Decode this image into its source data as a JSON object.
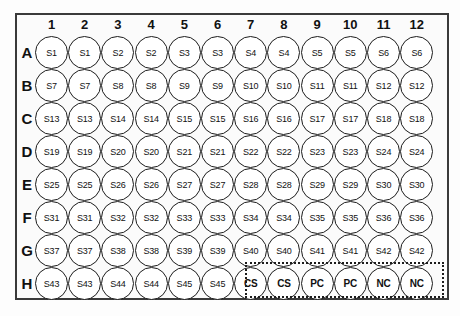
{
  "figure": {
    "kind": "96-well-plate-layout",
    "rows": [
      "A",
      "B",
      "C",
      "D",
      "E",
      "F",
      "G",
      "H"
    ],
    "columns": [
      "1",
      "2",
      "3",
      "4",
      "5",
      "6",
      "7",
      "8",
      "9",
      "10",
      "11",
      "12"
    ],
    "wells": [
      [
        "S1",
        "S1",
        "S2",
        "S2",
        "S3",
        "S3",
        "S4",
        "S4",
        "S5",
        "S5",
        "S6",
        "S6"
      ],
      [
        "S7",
        "S7",
        "S8",
        "S8",
        "S9",
        "S9",
        "S10",
        "S10",
        "S11",
        "S11",
        "S12",
        "S12"
      ],
      [
        "S13",
        "S13",
        "S14",
        "S14",
        "S15",
        "S15",
        "S16",
        "S16",
        "S17",
        "S17",
        "S18",
        "S18"
      ],
      [
        "S19",
        "S19",
        "S20",
        "S20",
        "S21",
        "S21",
        "S22",
        "S22",
        "S23",
        "S23",
        "S24",
        "S24"
      ],
      [
        "S25",
        "S25",
        "S26",
        "S26",
        "S27",
        "S27",
        "S28",
        "S28",
        "S29",
        "S29",
        "S30",
        "S30"
      ],
      [
        "S31",
        "S31",
        "S32",
        "S32",
        "S33",
        "S33",
        "S34",
        "S34",
        "S35",
        "S35",
        "S36",
        "S36"
      ],
      [
        "S37",
        "S37",
        "S38",
        "S38",
        "S39",
        "S39",
        "S40",
        "S40",
        "S41",
        "S41",
        "S42",
        "S42"
      ],
      [
        "S43",
        "S43",
        "S44",
        "S44",
        "S45",
        "S45",
        "CS",
        "CS",
        "PC",
        "PC",
        "NC",
        "NC"
      ]
    ],
    "control_labels": [
      "CS",
      "PC",
      "NC"
    ],
    "control_region": {
      "row": "H",
      "from_column": "7",
      "to_column": "12"
    },
    "colors": {
      "well_outline": "#1c1c1c",
      "plate_border": "#3a3a3a",
      "text": "#111111",
      "plate_fill": "#fbfbfb",
      "well_fill": "#ffffff"
    }
  }
}
